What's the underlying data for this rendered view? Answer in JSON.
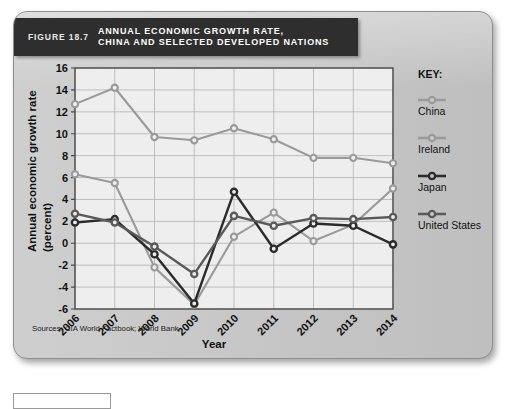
{
  "figure": {
    "number_label": "FIGURE 18.7",
    "title": "ANNUAL ECONOMIC GROWTH RATE,\nCHINA AND SELECTED DEVELOPED NATIONS",
    "source_note": "Sources: CIA World Factbook; World Bank"
  },
  "key": {
    "heading": "KEY:"
  },
  "chart_data": {
    "type": "line",
    "title": "ANNUAL ECONOMIC GROWTH RATE, CHINA AND SELECTED DEVELOPED NATIONS",
    "xlabel": "Year",
    "ylabel": "Annual economic growth rate (percent)",
    "categories": [
      "2006",
      "2007",
      "2008",
      "2009",
      "2010",
      "2011",
      "2012",
      "2013",
      "2014"
    ],
    "x": [
      2006,
      2007,
      2008,
      2009,
      2010,
      2011,
      2012,
      2013,
      2014
    ],
    "ylim": [
      -6,
      16
    ],
    "yticks": [
      -6,
      -4,
      -2,
      0,
      2,
      4,
      6,
      8,
      10,
      12,
      14,
      16
    ],
    "grid": true,
    "legend_position": "right",
    "series": [
      {
        "name": "China",
        "color": "#9a9a9a",
        "width": 2.1,
        "values": [
          12.7,
          14.2,
          9.7,
          9.4,
          10.5,
          9.5,
          7.8,
          7.8,
          7.3
        ]
      },
      {
        "name": "Ireland",
        "color": "#9a9a9a",
        "width": 2.1,
        "values": [
          6.3,
          5.5,
          -2.2,
          -5.6,
          0.6,
          2.8,
          0.2,
          1.7,
          5.0
        ]
      },
      {
        "name": "Japan",
        "color": "#2b2b2b",
        "width": 2.4,
        "values": [
          1.9,
          2.2,
          -1.0,
          -5.5,
          4.7,
          -0.5,
          1.8,
          1.6,
          -0.1
        ]
      },
      {
        "name": "United States",
        "color": "#5a5a5a",
        "width": 2.4,
        "values": [
          2.7,
          1.9,
          -0.3,
          -2.8,
          2.5,
          1.6,
          2.3,
          2.2,
          2.4
        ]
      }
    ]
  }
}
